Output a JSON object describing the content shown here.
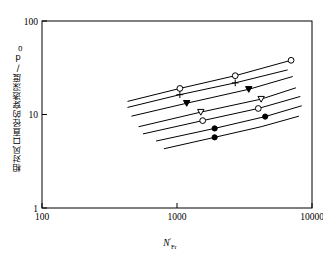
{
  "figure": {
    "background_color": "#ffffff",
    "line_color": "#000000"
  },
  "axes": {
    "x_title_base": "N",
    "x_title_prime": "'",
    "x_title_sub": "Fr",
    "y_title": "相对风口直径的穿透深度/d",
    "y_title_sub": "0",
    "x_ticks": [
      "100",
      "1000",
      "10000"
    ],
    "y_ticks": [
      "100",
      "10",
      "1"
    ]
  },
  "chart_data": {
    "type": "line",
    "title": "",
    "xlabel": "N'Fr",
    "ylabel": "相对风口直径的穿透深度/d0",
    "xscale": "log",
    "yscale": "log",
    "xlim": [
      100,
      10000
    ],
    "ylim": [
      1,
      100
    ],
    "grid": false,
    "legend": "none",
    "x_tick_values": [
      100,
      1000,
      10000
    ],
    "y_tick_values": [
      1,
      10,
      100
    ],
    "series": [
      {
        "name": "series-1",
        "marker": "open-circle",
        "x": [
          430,
          1050,
          2700,
          7000
        ],
        "y": [
          13.8,
          19.0,
          26.0,
          38.0
        ],
        "marker_x": [
          1050,
          2700,
          7000
        ],
        "marker_y": [
          19.0,
          26.0,
          38.0
        ]
      },
      {
        "name": "series-2",
        "marker": "plus",
        "x": [
          430,
          1050,
          2700,
          6600
        ],
        "y": [
          11.9,
          16.3,
          21.8,
          30.0
        ],
        "marker_x": [
          1050,
          2700
        ],
        "marker_y": [
          16.3,
          21.8
        ]
      },
      {
        "name": "series-3",
        "marker": "filled-triangle",
        "x": [
          460,
          1180,
          3400,
          7200
        ],
        "y": [
          9.6,
          13.2,
          18.6,
          25.5
        ],
        "marker_x": [
          1180,
          3400
        ],
        "marker_y": [
          13.2,
          18.6
        ]
      },
      {
        "name": "series-4",
        "marker": "open-triangle",
        "x": [
          520,
          1500,
          4200,
          7600
        ],
        "y": [
          7.4,
          10.6,
          14.6,
          19.3
        ],
        "marker_x": [
          1500,
          4200
        ],
        "marker_y": [
          10.6,
          14.6
        ]
      },
      {
        "name": "series-5",
        "marker": "open-circle",
        "x": [
          560,
          1550,
          4000,
          8200
        ],
        "y": [
          6.2,
          8.6,
          11.6,
          15.6
        ],
        "marker_x": [
          1550,
          4000
        ],
        "marker_y": [
          8.6,
          11.6
        ]
      },
      {
        "name": "series-6",
        "marker": "filled-circle",
        "x": [
          700,
          1900,
          4500,
          8400
        ],
        "y": [
          5.2,
          7.1,
          9.5,
          12.4
        ],
        "marker_x": [
          1900,
          4500
        ],
        "marker_y": [
          7.1,
          9.5
        ]
      },
      {
        "name": "series-7",
        "marker": "filled-circle",
        "x": [
          800,
          1900,
          4200,
          8000
        ],
        "y": [
          4.3,
          5.7,
          7.4,
          9.6
        ],
        "marker_x": [
          1900
        ],
        "marker_y": [
          5.7
        ]
      }
    ]
  }
}
